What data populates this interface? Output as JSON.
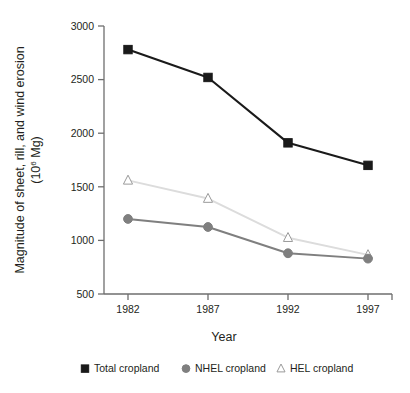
{
  "chart_data": {
    "type": "line",
    "title": "",
    "subtitle": "",
    "xlabel": "Year",
    "ylabel_line1": "Magnitude of sheet, rill, and wind erosion",
    "ylabel_line2_prefix": "(10",
    "ylabel_line2_sup": "6",
    "ylabel_line2_suffix": " Mg)",
    "ylabel": "Magnitude of sheet, rill, and wind erosion (10^6 Mg)",
    "x": [
      1982,
      1987,
      1992,
      1997
    ],
    "categories": [
      "1982",
      "1987",
      "1992",
      "1997"
    ],
    "xtick_labels": [
      "1982",
      "1987",
      "1992",
      "1997"
    ],
    "ytick_labels": [
      "500",
      "1000",
      "1500",
      "2000",
      "2500",
      "3000"
    ],
    "ytick_values": [
      500,
      1000,
      1500,
      2000,
      2500,
      3000
    ],
    "ylim": [
      500,
      3000
    ],
    "xlim": [
      1980.5,
      1998.5
    ],
    "grid": false,
    "legend_position": "bottom",
    "series": [
      {
        "name": "Total cropland",
        "marker": "square",
        "color": "#1a1a1a",
        "line_color": "#1a1a1a",
        "values": [
          2780,
          2520,
          1910,
          1700
        ]
      },
      {
        "name": "NHEL cropland",
        "marker": "circle",
        "color": "#7f7f7f",
        "line_color": "#7f7f7f",
        "values": [
          1200,
          1125,
          880,
          830
        ]
      },
      {
        "name": "HEL cropland",
        "marker": "triangle",
        "color": "#ffffff",
        "line_color": "#dcdcdc",
        "marker_edge": "#9a9a9a",
        "values": [
          1560,
          1390,
          1025,
          865
        ]
      }
    ]
  },
  "legend": {
    "items": [
      {
        "label": "Total cropland",
        "marker": "square"
      },
      {
        "label": "NHEL cropland",
        "marker": "circle"
      },
      {
        "label": "HEL cropland",
        "marker": "triangle"
      }
    ]
  },
  "axis": {
    "x_title": "Year",
    "y_title_line1": "Magnitude of sheet, rill, and wind erosion",
    "y_title_line2": "(106 Mg)"
  },
  "colors": {
    "total_cropland": "#1a1a1a",
    "nhel_cropland": "#7f7f7f",
    "hel_cropland_line": "#dcdcdc",
    "hel_cropland_marker_edge": "#9a9a9a",
    "axis": "#6e6e6e",
    "text": "#231f20",
    "background": "#ffffff"
  }
}
